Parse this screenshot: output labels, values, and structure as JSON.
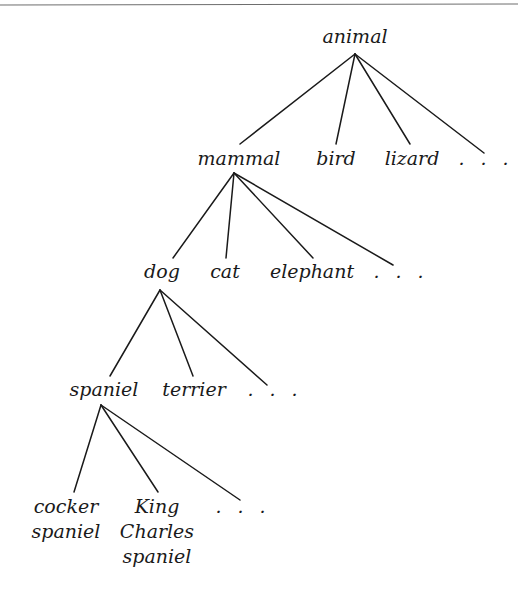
{
  "diagram": {
    "type": "tree",
    "title": "",
    "colors": {
      "line": "#1a1a1a",
      "text": "#1a1a1a",
      "rule": "#6e6e6e",
      "background": "#ffffff"
    },
    "top_rule": {
      "x1": 0,
      "y1": 5,
      "x2": 518,
      "y2": 4
    },
    "nodes": [
      {
        "id": "animal",
        "lines": [
          "animal"
        ],
        "x": 355,
        "y": 43,
        "anchor": {
          "x": 355,
          "y": 54
        }
      },
      {
        "id": "mammal",
        "lines": [
          "mammal"
        ],
        "x": 239,
        "y": 165,
        "top": {
          "x": 240,
          "y": 144
        },
        "anchor": {
          "x": 234,
          "y": 173
        }
      },
      {
        "id": "bird",
        "lines": [
          "bird"
        ],
        "x": 336,
        "y": 165,
        "top": {
          "x": 336,
          "y": 144
        }
      },
      {
        "id": "lizard",
        "lines": [
          "lizard"
        ],
        "x": 412,
        "y": 165,
        "top": {
          "x": 410,
          "y": 144
        }
      },
      {
        "id": "animal-more",
        "lines": [
          "…"
        ],
        "x": 486,
        "y": 165,
        "top": {
          "x": 484,
          "y": 153
        },
        "ellipsis": true
      },
      {
        "id": "dog",
        "lines": [
          "dog"
        ],
        "x": 162,
        "y": 278,
        "top": {
          "x": 173,
          "y": 258
        },
        "anchor": {
          "x": 160,
          "y": 290
        }
      },
      {
        "id": "cat",
        "lines": [
          "cat"
        ],
        "x": 225,
        "y": 278,
        "top": {
          "x": 226,
          "y": 258
        }
      },
      {
        "id": "elephant",
        "lines": [
          "elephant"
        ],
        "x": 312,
        "y": 278,
        "top": {
          "x": 313,
          "y": 258
        }
      },
      {
        "id": "mammal-more",
        "lines": [
          "…"
        ],
        "x": 401,
        "y": 278,
        "top": {
          "x": 393,
          "y": 265
        },
        "ellipsis": true
      },
      {
        "id": "spaniel",
        "lines": [
          "spaniel"
        ],
        "x": 104,
        "y": 396,
        "top": {
          "x": 110,
          "y": 376
        },
        "anchor": {
          "x": 101,
          "y": 405
        }
      },
      {
        "id": "terrier",
        "lines": [
          "terrier"
        ],
        "x": 194,
        "y": 396,
        "top": {
          "x": 193,
          "y": 376
        }
      },
      {
        "id": "dog-more",
        "lines": [
          "…"
        ],
        "x": 275,
        "y": 396,
        "top": {
          "x": 267,
          "y": 385
        },
        "ellipsis": true
      },
      {
        "id": "cocker-spaniel",
        "lines": [
          "cocker",
          "spaniel"
        ],
        "x": 66,
        "y": 513,
        "top": {
          "x": 74,
          "y": 492
        }
      },
      {
        "id": "king-charles-spaniel",
        "lines": [
          "King",
          "Charles",
          "spaniel"
        ],
        "x": 157,
        "y": 513,
        "top": {
          "x": 158,
          "y": 492
        }
      },
      {
        "id": "spaniel-more",
        "lines": [
          "…"
        ],
        "x": 243,
        "y": 513,
        "top": {
          "x": 240,
          "y": 500
        },
        "ellipsis": true
      }
    ],
    "edges": [
      [
        "animal",
        "mammal"
      ],
      [
        "animal",
        "bird"
      ],
      [
        "animal",
        "lizard"
      ],
      [
        "animal",
        "animal-more"
      ],
      [
        "mammal",
        "dog"
      ],
      [
        "mammal",
        "cat"
      ],
      [
        "mammal",
        "elephant"
      ],
      [
        "mammal",
        "mammal-more"
      ],
      [
        "dog",
        "spaniel"
      ],
      [
        "dog",
        "terrier"
      ],
      [
        "dog",
        "dog-more"
      ],
      [
        "spaniel",
        "cocker-spaniel"
      ],
      [
        "spaniel",
        "king-charles-spaniel"
      ],
      [
        "spaniel",
        "spaniel-more"
      ]
    ],
    "line_height": 25
  }
}
